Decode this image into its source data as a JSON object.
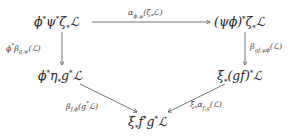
{
  "diagram": {
    "type": "commutative-diagram",
    "nodes": {
      "top_left": "ϕ*ψ*ζ*ℒ",
      "top_right": "(ψϕ)*ζ*ℒ",
      "mid_left": "ϕ*η*g*ℒ",
      "mid_right": "ξ*(gf)*ℒ",
      "bottom": "ξ*f*g*ℒ"
    },
    "arrows": {
      "top": "αϕ,ψ(ζ*ℒ)",
      "left": "ϕ*βg,ψ(ℒ)",
      "right": "βgf,ψϕ(ℒ)",
      "bottom_left": "βf,ϕ(g*ℒ)",
      "bottom_right": "ξ*αf,g(ℒ)"
    }
  }
}
